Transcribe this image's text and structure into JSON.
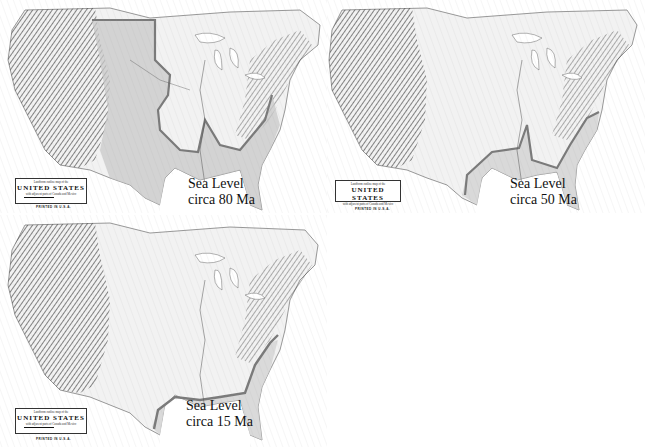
{
  "figure": {
    "panels": [
      {
        "id": "p80",
        "caption_line1": "Sea Level",
        "caption_line2": "circa 80 Ma",
        "sea_shading": "#c8c8c8",
        "shoreline_color": "#7a7a7a"
      },
      {
        "id": "p50",
        "caption_line1": "Sea Level",
        "caption_line2": "circa 50 Ma",
        "sea_shading": "#d2d2d2",
        "shoreline_color": "#7a7a7a"
      },
      {
        "id": "p15",
        "caption_line1": "Sea Level",
        "caption_line2": "circa 15 Ma",
        "sea_shading": "#d6d6d6",
        "shoreline_color": "#7a7a7a"
      }
    ],
    "map_legend": {
      "line1": "Landform outline map of the",
      "title": "UNITED STATES",
      "line3": "with adjacent parts of Canada and Mexico",
      "author_left": "by Erwin Raisz",
      "author_right": "WOODY LOVELAND",
      "printed": "PRINTED IN U.S.A."
    }
  }
}
